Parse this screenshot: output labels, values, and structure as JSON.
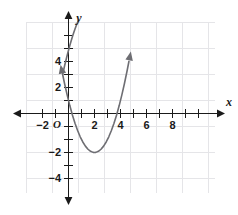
{
  "figure": {
    "background_color": "#ffffff",
    "grid_color": "#e3e3e6",
    "axis_color": "#1a1a1a",
    "curve_color": "#6e6e73",
    "origin_label": "O",
    "x_axis_name": "x",
    "y_axis_name": "y"
  },
  "chart_data": {
    "type": "line",
    "title": "",
    "subtitle": "",
    "xlabel": "x",
    "ylabel": "y",
    "xlim": [
      -3,
      9
    ],
    "ylim": [
      -5,
      6
    ],
    "grid": true,
    "legend": null,
    "x_ticks": [
      -2,
      2,
      4,
      6,
      8
    ],
    "x_tick_labels": [
      "−2",
      "2",
      "4",
      "6",
      "8"
    ],
    "y_ticks": [
      -4,
      -2,
      2,
      4
    ],
    "y_tick_labels": [
      "−4",
      "−2",
      "2",
      "4"
    ],
    "equation": "y = (x - 2)^2 - 3",
    "vertex": [
      2,
      -3
    ],
    "x_intercepts": [
      0.27,
      3.73
    ],
    "y_intercept": 1,
    "series": [
      {
        "name": "parabola",
        "x": [
          -0.45,
          -0.3,
          -0.1,
          0.1,
          0.3,
          0.5,
          0.7,
          0.9,
          1.1,
          1.3,
          1.5,
          1.7,
          1.9,
          2.0,
          2.1,
          2.3,
          2.5,
          2.7,
          2.9,
          3.1,
          3.3,
          3.5,
          3.7,
          3.9,
          4.1,
          4.3,
          4.5,
          4.65
        ],
        "y": [
          3.0,
          2.29,
          1.41,
          0.61,
          -0.11,
          -0.75,
          -1.31,
          -1.79,
          -2.19,
          -2.51,
          -2.75,
          -2.91,
          -2.99,
          -3.0,
          -2.99,
          -2.91,
          -2.75,
          -2.51,
          -2.19,
          -1.79,
          -1.31,
          -0.75,
          -0.11,
          0.61,
          1.41,
          2.29,
          3.25,
          4.02
        ]
      }
    ]
  }
}
